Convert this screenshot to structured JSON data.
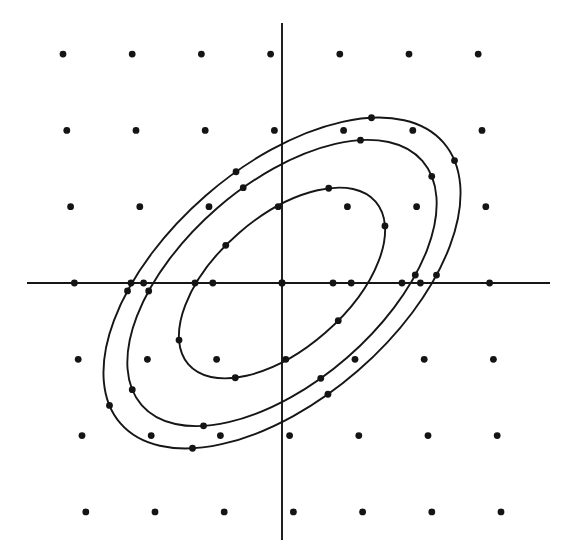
{
  "figure": {
    "title": "Lattice points with three concentric tilted ellipses",
    "background_color": "#ffffff",
    "ink_color": "#161616",
    "width": 569,
    "height": 560
  },
  "chart_data": {
    "type": "scatter",
    "title": "Lattice points with three concentric tilted ellipses",
    "subtitle": "Level curves of a positive definite binary quadratic form on a 7x7 point lattice",
    "xlabel": "",
    "ylabel": "",
    "grid": false,
    "legend": null,
    "axes": {
      "x_axis": {
        "visible": true,
        "y_pixel": 283,
        "x_start_pixel": 27,
        "x_end_pixel": 550,
        "ticks": [],
        "tick_labels": []
      },
      "y_axis": {
        "visible": true,
        "x_pixel": 282,
        "y_start_pixel": 23,
        "y_end_pixel": 540,
        "ticks": [],
        "tick_labels": []
      },
      "origin_pixel": [
        282,
        283
      ]
    },
    "lattice": {
      "rows": 7,
      "cols": 7,
      "basis_vector_a_pixels": [
        69.2,
        0
      ],
      "basis_vector_b_pixels": [
        -3.8,
        -76.3
      ],
      "origin_index": [
        3,
        3
      ],
      "dot_radius_px": 3.4,
      "point_count": 49,
      "points_pixels": [
        [
          52,
          55
        ],
        [
          121,
          55
        ],
        [
          190,
          55
        ],
        [
          259,
          55
        ],
        [
          329,
          55
        ],
        [
          398,
          55
        ],
        [
          467,
          55
        ],
        [
          52,
          131
        ],
        [
          121,
          131
        ],
        [
          190,
          131
        ],
        [
          259,
          131
        ],
        [
          329,
          131
        ],
        [
          398,
          131
        ],
        [
          467,
          131
        ],
        [
          52,
          207
        ],
        [
          121,
          207
        ],
        [
          190,
          207
        ],
        [
          259,
          207
        ],
        [
          329,
          207
        ],
        [
          398,
          207
        ],
        [
          467,
          207
        ],
        [
          57,
          283
        ],
        [
          126,
          283
        ],
        [
          195,
          283
        ],
        [
          282,
          283
        ],
        [
          333,
          283
        ],
        [
          402,
          283
        ],
        [
          512,
          283
        ],
        [
          52,
          357
        ],
        [
          121,
          357
        ],
        [
          190,
          357
        ],
        [
          259,
          357
        ],
        [
          329,
          357
        ],
        [
          398,
          357
        ],
        [
          467,
          357
        ],
        [
          52,
          433
        ],
        [
          121,
          433
        ],
        [
          190,
          433
        ],
        [
          259,
          433
        ],
        [
          329,
          433
        ],
        [
          398,
          433
        ],
        [
          467,
          433
        ],
        [
          52,
          510
        ],
        [
          121,
          510
        ],
        [
          190,
          510
        ],
        [
          259,
          510
        ],
        [
          329,
          510
        ],
        [
          398,
          510
        ],
        [
          467,
          510
        ]
      ]
    },
    "ellipses": [
      {
        "name": "inner-ellipse",
        "level": 1,
        "center_pixels": [
          282,
          283
        ],
        "semi_major_px": 124,
        "semi_minor_px": 66,
        "rotation_deg": -41,
        "lattice_points_on_curve": 6
      },
      {
        "name": "middle-ellipse",
        "level": 2,
        "center_pixels": [
          282,
          283
        ],
        "semi_major_px": 186,
        "semi_minor_px": 99,
        "rotation_deg": -41,
        "lattice_points_on_curve": 8
      },
      {
        "name": "outer-ellipse",
        "level": 3,
        "center_pixels": [
          282,
          283
        ],
        "semi_major_px": 214,
        "semi_minor_px": 116,
        "rotation_deg": -41,
        "lattice_points_on_curve": 8
      }
    ],
    "marked_points_pixels": [
      [
        131,
        283
      ],
      [
        195,
        283
      ],
      [
        333,
        283
      ],
      [
        402,
        283
      ],
      [
        210,
        131
      ],
      [
        282,
        131
      ],
      [
        355,
        207
      ],
      [
        355,
        360
      ],
      [
        211,
        359
      ],
      [
        283,
        360
      ],
      [
        139,
        207
      ],
      [
        262,
        435
      ],
      [
        355,
        434
      ],
      [
        211,
        212
      ],
      [
        297,
        356
      ],
      [
        437,
        360
      ],
      [
        437,
        434
      ],
      [
        139,
        137
      ],
      [
        283,
        510
      ],
      [
        282,
        55
      ]
    ]
  }
}
